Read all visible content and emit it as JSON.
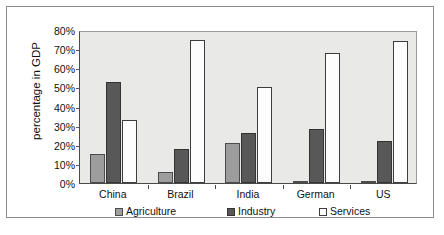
{
  "chart_data": {
    "type": "bar",
    "title": "",
    "subtitle": "",
    "xlabel": "",
    "ylabel": "percentage in GDP",
    "categories": [
      "China",
      "Brazil",
      "India",
      "German",
      "US"
    ],
    "series": [
      {
        "name": "Agriculture",
        "color": "#9d9d9d",
        "values": [
          15,
          6,
          21,
          1,
          1
        ]
      },
      {
        "name": "Industry",
        "color": "#585858",
        "values": [
          53,
          18,
          26,
          28,
          22
        ]
      },
      {
        "name": "Services",
        "color": "#fdfdfd",
        "values": [
          33,
          75,
          50,
          68,
          74
        ]
      }
    ],
    "ylim": [
      0,
      80
    ],
    "ytick_values": [
      0,
      10,
      20,
      30,
      40,
      50,
      60,
      70,
      80
    ],
    "ytick_labels": [
      "0%",
      "10%",
      "20%",
      "30%",
      "40%",
      "50%",
      "60%",
      "70%",
      "80%"
    ],
    "grid": false,
    "legend_position": "bottom",
    "plot_background": "#e9e9e7",
    "value_suffix": "%"
  },
  "figure": {
    "caption": ""
  }
}
